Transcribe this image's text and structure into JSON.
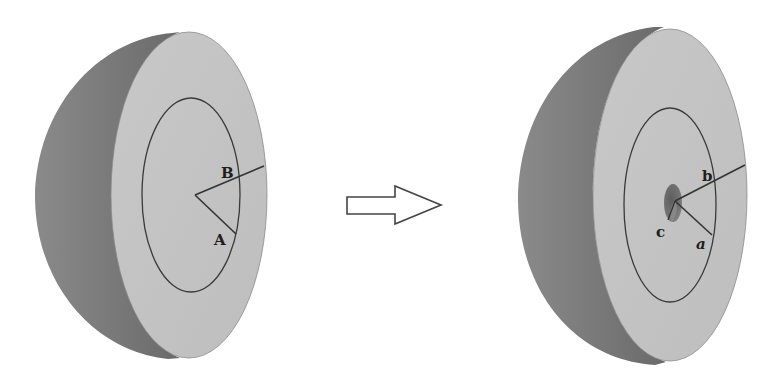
{
  "diagram": {
    "left_figure": {
      "labels": {
        "inner_radius": "A",
        "outer_radius": "B"
      }
    },
    "arrow": {
      "direction": "right"
    },
    "right_figure": {
      "labels": {
        "inner_radius": "a",
        "outer_radius": "b",
        "cavity_radius": "c"
      }
    },
    "colors": {
      "face": "#c3c3c3",
      "shell_dark": "#7a7a7a",
      "shell_light": "#9a9a9a",
      "line": "#333333",
      "cavity": "#6e6e6e"
    }
  }
}
